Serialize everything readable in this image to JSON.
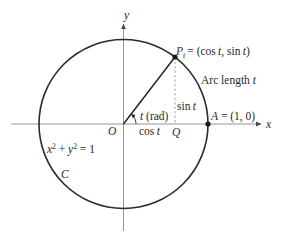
{
  "diagram": {
    "colors": {
      "curve": "#2b2b2b",
      "axis": "#7a7a7a",
      "radius": "#1f1f1f",
      "dashed": "#9a9a9a",
      "text": "#2a2a2a",
      "background": "#ffffff"
    },
    "geometry": {
      "origin_px": [
        123.5,
        124
      ],
      "radius_px": 84.5,
      "angle_t_deg": 52.4,
      "point_P_px": [
        175,
        57
      ],
      "point_A_px": [
        208,
        124
      ],
      "point_Q_px": [
        175,
        124
      ]
    },
    "axes": {
      "x_label": "x",
      "y_label": "y"
    },
    "labels": {
      "origin": "O",
      "point_P_main": "P",
      "point_P_sub": "t",
      "point_P_eq": "= (cos ",
      "point_P_t1": "t",
      "point_P_mid": ", sin ",
      "point_P_t2": "t",
      "point_P_close": ")",
      "arc_length_prefix": "Arc length ",
      "arc_length_var": "t",
      "sin_prefix": "sin ",
      "sin_var": "t",
      "cos_prefix": "cos ",
      "cos_var": "t",
      "angle_var": "t",
      "angle_unit": " (rad)",
      "point_Q": "Q",
      "point_A_name": "A",
      "point_A_coords": " = (1, 0)",
      "eq_x": "x",
      "eq_x_exp": "2",
      "eq_plus": " + ",
      "eq_y": "y",
      "eq_y_exp": "2",
      "eq_rhs": " = 1",
      "curve_name": "C"
    }
  }
}
